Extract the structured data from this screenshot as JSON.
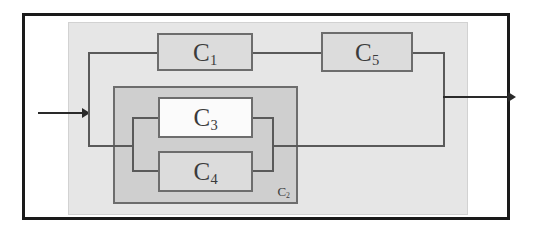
{
  "diagram": {
    "title": "Reliability block diagram of a system with series and parallel components",
    "type": "reliability-block-diagram",
    "colors": {
      "frame": "#1a1a1a",
      "system_panel": "#e6e6e6",
      "subsystem_panel": "#cfcfcf",
      "block_gray": "#dcdcdc",
      "block_white": "#fbfbfb",
      "block_border": "#6d6d6d",
      "wire": "#5a5a5a",
      "arrow": "#2a2a2a",
      "text": "#3b3b3b"
    },
    "input": {
      "name": "input-arrow",
      "label": ""
    },
    "output": {
      "name": "output-arrow",
      "label": ""
    },
    "blocks": [
      {
        "id": "c1",
        "base": "C",
        "sub": "1",
        "label": "C1",
        "fill": "gray",
        "x": 157,
        "y": 33,
        "w": 96,
        "h": 38
      },
      {
        "id": "c5",
        "base": "C",
        "sub": "5",
        "label": "C5",
        "fill": "gray",
        "x": 321,
        "y": 32,
        "w": 92,
        "h": 40
      },
      {
        "id": "c3",
        "base": "C",
        "sub": "3",
        "label": "C3",
        "fill": "white",
        "x": 158,
        "y": 97,
        "w": 95,
        "h": 41
      },
      {
        "id": "c4",
        "base": "C",
        "sub": "4",
        "label": "C4",
        "fill": "gray",
        "x": 158,
        "y": 151,
        "w": 95,
        "h": 41
      }
    ],
    "subsystem": {
      "id": "c2",
      "base": "C",
      "sub": "2",
      "label": "C2",
      "x": 113,
      "y": 86,
      "w": 185,
      "h": 118
    },
    "structure": {
      "top_path": [
        "C1",
        "C5"
      ],
      "bottom_path": [
        "C2"
      ],
      "c2_contains_parallel": [
        "C3",
        "C4"
      ],
      "description": "C1 and C5 in series form the upper path; subsystem C2 (C3 parallel C4) forms the lower path; the two paths are in parallel between input and output."
    }
  }
}
